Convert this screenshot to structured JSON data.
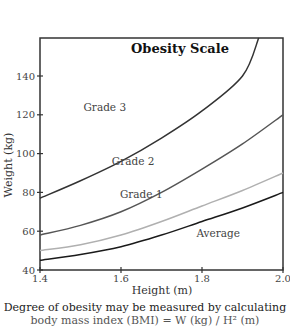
{
  "chart_data": {
    "type": "line",
    "title": "Obesity Scale",
    "xlabel": "Height (m)",
    "ylabel": "Weight (kg)",
    "xlim": [
      1.4,
      2.0
    ],
    "ylim": [
      40,
      160
    ],
    "x_ticks": [
      1.4,
      1.6,
      1.8,
      2.0
    ],
    "x_tick_labels": [
      "1.4",
      "1.6",
      "1.8",
      "2.0"
    ],
    "y_ticks": [
      40,
      60,
      80,
      100,
      120,
      140
    ],
    "y_tick_labels": [
      "40",
      "60",
      "80",
      "100",
      "120",
      "140"
    ],
    "grid": false,
    "legend": "inline labels",
    "x": [
      1.4,
      1.5,
      1.6,
      1.7,
      1.8,
      1.9,
      2.0
    ],
    "series": [
      {
        "name": "Average",
        "color": "#1a1a1a",
        "values": [
          45,
          48,
          52,
          58,
          65,
          72,
          80
        ],
        "label_pos": [
          1.84,
          57
        ]
      },
      {
        "name": "Grade 1",
        "color": "#b0b0b0",
        "values": [
          50,
          53,
          58,
          65,
          73,
          81,
          90
        ],
        "label_pos": [
          1.65,
          77
        ]
      },
      {
        "name": "Grade 2",
        "color": "#555555",
        "values": [
          58,
          63,
          70,
          80,
          92,
          105,
          120
        ],
        "label_pos": [
          1.63,
          94
        ]
      },
      {
        "name": "Grade 3",
        "color": "#333333",
        "values": [
          77,
          86,
          96,
          108,
          122,
          140,
          160
        ],
        "x_override": [
          1.4,
          1.5,
          1.6,
          1.7,
          1.8,
          1.9,
          1.94
        ],
        "label_pos": [
          1.56,
          122
        ]
      }
    ]
  },
  "caption": {
    "line1": "Degree of obesity may be measured by calculating",
    "line2": "body mass index (BMI) = W (kg) / H² (m)"
  }
}
